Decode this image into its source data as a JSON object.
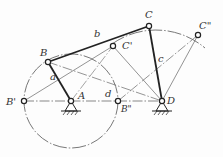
{
  "diagram": {
    "type": "four-bar linkage (crank-rocker) extreme positions",
    "points": {
      "A": {
        "label": "A",
        "x": 71,
        "y": 101
      },
      "B": {
        "label": "B",
        "x": 48,
        "y": 62
      },
      "C": {
        "label": "C",
        "x": 149,
        "y": 26
      },
      "D": {
        "label": "D",
        "x": 162,
        "y": 101
      },
      "B1": {
        "label": "B'",
        "x": 24,
        "y": 101
      },
      "B2": {
        "label": "B\"",
        "x": 118,
        "y": 101
      },
      "C1": {
        "label": "C'",
        "x": 113,
        "y": 46
      },
      "C2": {
        "label": "C\"",
        "x": 198,
        "y": 35
      }
    },
    "links": {
      "a": {
        "label": "a"
      },
      "b": {
        "label": "b"
      },
      "c": {
        "label": "c"
      },
      "d": {
        "label": "d"
      }
    },
    "crank_circle": {
      "cx": 71,
      "cy": 101,
      "r": 47
    },
    "rocker_arc": {
      "cx": 162,
      "cy": 101,
      "r": 76
    }
  },
  "labels": {
    "A": "A",
    "B": "B",
    "C": "C",
    "D": "D",
    "B1": "B'",
    "B2": "B\"",
    "C1": "C'",
    "C2": "C\"",
    "a": "a",
    "b": "b",
    "c": "c",
    "d": "d"
  }
}
